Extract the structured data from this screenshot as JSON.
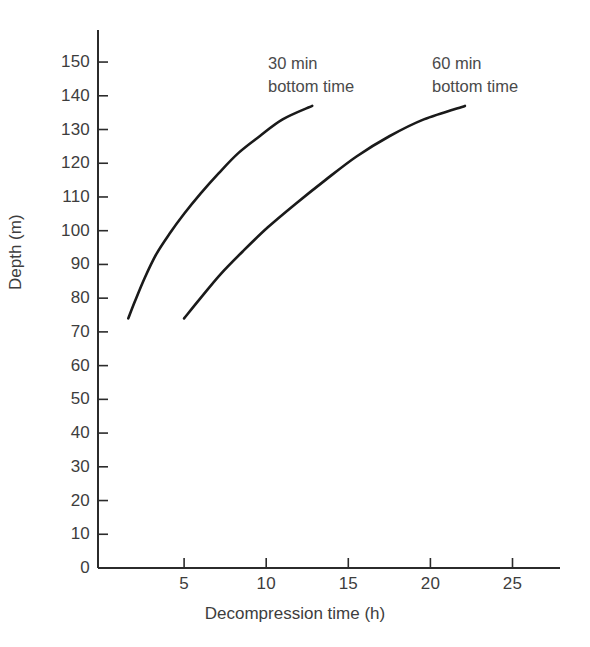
{
  "chart_data": {
    "type": "line",
    "title": "",
    "subtitle": "",
    "xlabel": "Decompression time  (h)",
    "ylabel": "Depth (m)",
    "xlim": [
      0,
      28
    ],
    "ylim": [
      0,
      158
    ],
    "xticks": [
      5,
      10,
      15,
      20,
      25
    ],
    "yticks": [
      0,
      10,
      20,
      30,
      40,
      50,
      60,
      70,
      80,
      90,
      100,
      110,
      120,
      130,
      140,
      150
    ],
    "xtick_labels": [
      "5",
      "10",
      "15",
      "20",
      "25"
    ],
    "ytick_labels": [
      "0",
      "10",
      "20",
      "30",
      "40",
      "50",
      "60",
      "70",
      "80",
      "90",
      "100",
      "110",
      "120",
      "130",
      "140",
      "150"
    ],
    "grid": false,
    "legend_position": "inline-annotations",
    "line_color": "#1a1a1a",
    "axis_color": "#2b2b2b",
    "background_color": "#ffffff",
    "series": [
      {
        "name": "30 min bottom time",
        "annotation": "30 min\nbottom time",
        "annotation_line1": "30 min",
        "annotation_line2": "bottom time",
        "x": [
          1.6,
          2.0,
          2.6,
          3.3,
          4.1,
          5.0,
          6.0,
          7.1,
          8.3,
          9.6,
          11.0,
          12.8
        ],
        "y": [
          74,
          79,
          86,
          93,
          99,
          105,
          111,
          117,
          123,
          128,
          133,
          137
        ]
      },
      {
        "name": "60 min bottom time",
        "annotation": "60 min\nbottom time",
        "annotation_line1": "60 min",
        "annotation_line2": "bottom time",
        "x": [
          5.0,
          6.0,
          7.2,
          8.6,
          10.1,
          11.8,
          13.6,
          15.5,
          17.5,
          19.6,
          22.1
        ],
        "y": [
          74,
          80,
          87,
          94,
          101,
          108,
          115,
          122,
          128,
          133,
          137
        ]
      }
    ]
  },
  "axes": {
    "y_title": "Depth (m)",
    "x_title": "Decompression time  (h)"
  },
  "annotations": {
    "curve1": {
      "line1": "30 min",
      "line2": "bottom time"
    },
    "curve2": {
      "line1": "60 min",
      "line2": "bottom time"
    }
  }
}
